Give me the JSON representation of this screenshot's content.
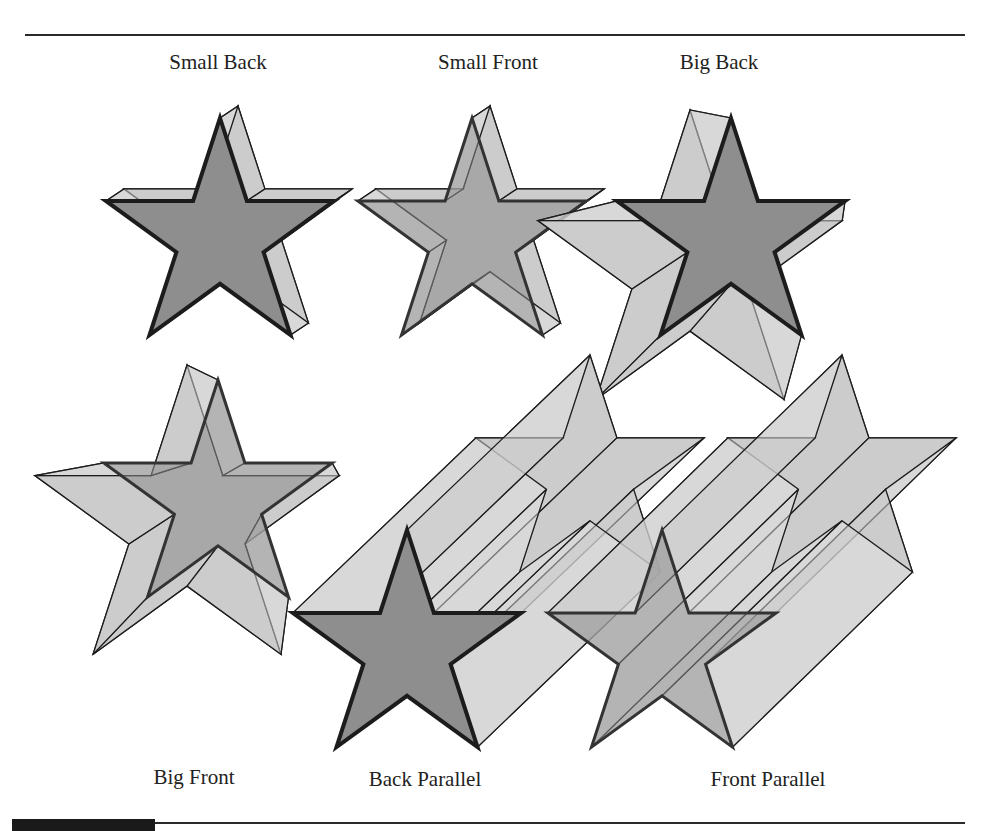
{
  "figure": {
    "colors": {
      "back_face": "#c9c9c9",
      "side_face": "#d4d4d4",
      "front_face_solid": "#8e8e8e",
      "front_face_transparent": "rgba(140,140,140,0.55)",
      "stroke": "#1c1c1c"
    },
    "labels": [
      {
        "id": "small-back",
        "text": "Small Back",
        "x": 218,
        "y": 50
      },
      {
        "id": "small-front",
        "text": "Small Front",
        "x": 488,
        "y": 50
      },
      {
        "id": "big-back",
        "text": "Big Back",
        "x": 719,
        "y": 50
      },
      {
        "id": "big-front",
        "text": "Big Front",
        "x": 194,
        "y": 765
      },
      {
        "id": "back-parallel",
        "text": "Back Parallel",
        "x": 425,
        "y": 767
      },
      {
        "id": "front-parallel",
        "text": "Front Parallel",
        "x": 768,
        "y": 767
      }
    ],
    "stars": [
      {
        "id": "small-back",
        "front": {
          "cx": 220,
          "cy": 238,
          "r": 120,
          "rot": 0
        },
        "back": {
          "cx": 238,
          "cy": 226,
          "r": 120
        },
        "front_mode": "solid"
      },
      {
        "id": "small-front",
        "front": {
          "cx": 472,
          "cy": 238,
          "r": 120,
          "rot": 0
        },
        "back": {
          "cx": 490,
          "cy": 226,
          "r": 120
        },
        "front_mode": "transparent"
      },
      {
        "id": "big-back",
        "front": {
          "cx": 731,
          "cy": 238,
          "r": 120,
          "rot": 0
        },
        "back": {
          "cx": 690,
          "cy": 270,
          "r": 160
        },
        "front_mode": "solid"
      },
      {
        "id": "big-front",
        "front": {
          "cx": 218,
          "cy": 500,
          "r": 120,
          "rot": 0
        },
        "back": {
          "cx": 187,
          "cy": 525,
          "r": 160
        },
        "front_mode": "transparent"
      },
      {
        "id": "back-parallel",
        "front": {
          "cx": 407,
          "cy": 650,
          "r": 120,
          "rot": 0
        },
        "back": {
          "cx": 590,
          "cy": 475,
          "r": 120
        },
        "front_mode": "solid"
      },
      {
        "id": "front-parallel",
        "front": {
          "cx": 662,
          "cy": 650,
          "r": 120,
          "rot": 0
        },
        "back": {
          "cx": 842,
          "cy": 475,
          "r": 120
        },
        "front_mode": "transparent"
      }
    ]
  }
}
